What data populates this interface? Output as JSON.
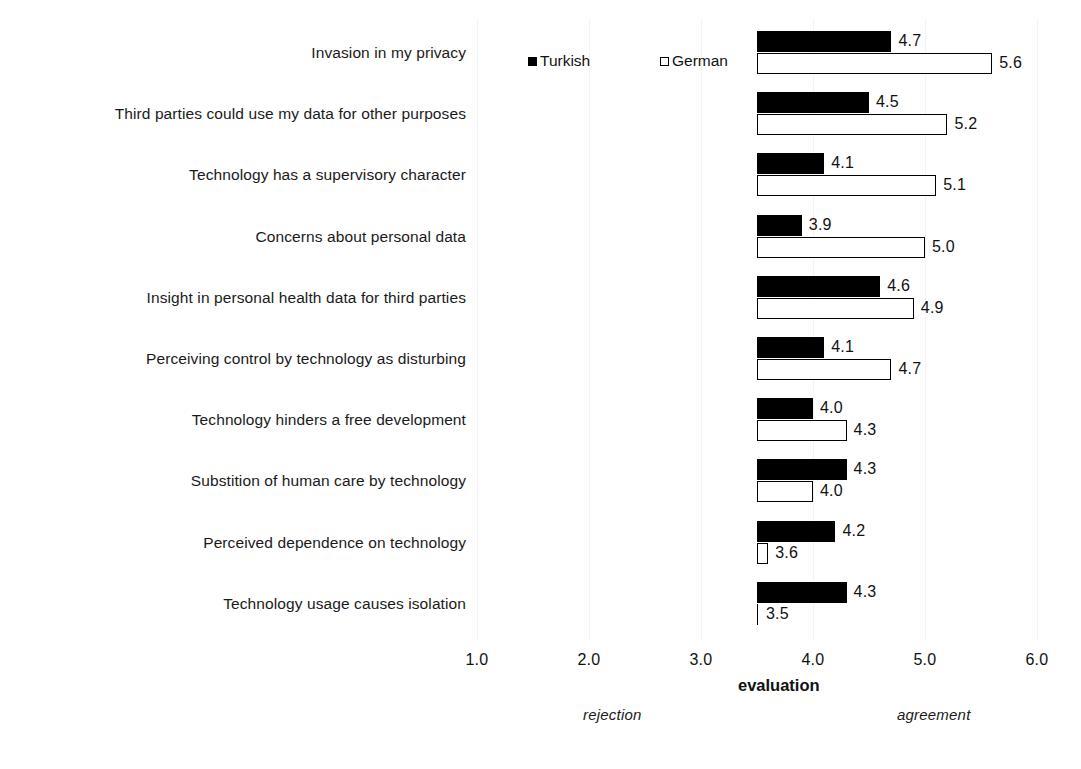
{
  "chart_data": {
    "type": "bar",
    "orientation": "horizontal",
    "title": "",
    "xlabel": "evaluation",
    "ylabel": "",
    "xlim": [
      1.0,
      6.0
    ],
    "bar_origin": 3.5,
    "grid": "faint-vertical",
    "legend_position": "top-center",
    "categories": [
      "Invasion in my privacy",
      "Third parties could use my data for other purposes",
      "Technology has a supervisory character",
      "Concerns about personal data",
      "Insight in personal health data for third parties",
      "Perceiving control by technology as disturbing",
      "Technology hinders a free development",
      "Substition of human care by technology",
      "Perceived dependence on technology",
      "Technology usage causes isolation"
    ],
    "series": [
      {
        "name": "Turkish",
        "color": "#000000",
        "style": "filled",
        "values": [
          4.7,
          4.5,
          4.1,
          3.9,
          4.6,
          4.1,
          4.0,
          4.3,
          4.2,
          4.3
        ],
        "labels": [
          "4.7",
          "4.5",
          "4.1",
          "3.9",
          "4.6",
          "4.1",
          "4.0",
          "4.3",
          "4.2",
          "4.3"
        ]
      },
      {
        "name": "German",
        "color": "#ffffff",
        "style": "open",
        "values": [
          5.6,
          5.2,
          5.1,
          5.0,
          4.9,
          4.7,
          4.3,
          4.0,
          3.6,
          3.5
        ],
        "labels": [
          "5.6",
          "5.2",
          "5.1",
          "5.0",
          "4.9",
          "4.7",
          "4.3",
          "4.0",
          "3.6",
          "3.5"
        ]
      }
    ],
    "xticks": [
      1.0,
      2.0,
      3.0,
      4.0,
      5.0,
      6.0
    ],
    "xtick_labels": [
      "1.0",
      "2.0",
      "3.0",
      "4.0",
      "5.0",
      "6.0"
    ],
    "annotations": [
      {
        "text": "rejection",
        "style": "italic",
        "position": "below-axis-left"
      },
      {
        "text": "agreement",
        "style": "italic",
        "position": "below-axis-right"
      }
    ]
  },
  "legend": {
    "items": [
      {
        "label": "Turkish",
        "swatch": "filled-square"
      },
      {
        "label": "German",
        "swatch": "open-square"
      }
    ]
  },
  "axis": {
    "title": "evaluation"
  }
}
